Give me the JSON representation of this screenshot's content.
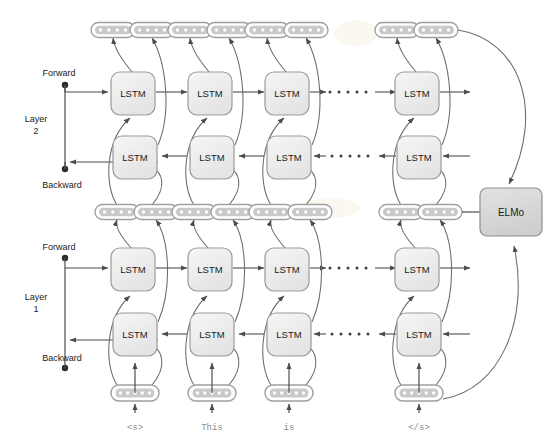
{
  "diagram": {
    "colors": {
      "box_fill": "#eeeeee",
      "box_stroke": "#9a9a9a",
      "pill_fill": "#ffffff",
      "pill_inner_fill": "#c9c9c9",
      "pill_stroke": "#a6a6a6",
      "arrow": "#4d4d4d",
      "text": "#1a1a1a",
      "token_text": "#8a8a8a",
      "elmo_fill": "#d9d9d9",
      "background": "#ffffff"
    },
    "layers": [
      {
        "id": "layer2",
        "label_line1": "Layer",
        "label_line2": "2",
        "forward_label": "Forward",
        "backward_label": "Backward"
      },
      {
        "id": "layer1",
        "label_line1": "Layer",
        "label_line2": "1",
        "forward_label": "Forward",
        "backward_label": "Backward"
      }
    ],
    "cell_label": "LSTM",
    "output_node_label": "ELMo",
    "ellipsis_dot_count": 5,
    "pill_dot_count_top": 4,
    "pill_dot_count_input": 5,
    "tokens": [
      "<s>",
      "This",
      "is",
      "</s>"
    ],
    "columns": [
      {
        "index": 0,
        "token": "<s>",
        "x": 133
      },
      {
        "index": 1,
        "token": "This",
        "x": 210
      },
      {
        "index": 2,
        "token": "is",
        "x": 287
      },
      {
        "index": 3,
        "token": "</s>",
        "x": 417
      }
    ],
    "cells": [
      {
        "layer": 2,
        "direction": "forward",
        "label": "LSTM",
        "column": 0
      },
      {
        "layer": 2,
        "direction": "forward",
        "label": "LSTM",
        "column": 1
      },
      {
        "layer": 2,
        "direction": "forward",
        "label": "LSTM",
        "column": 2
      },
      {
        "layer": 2,
        "direction": "forward",
        "label": "LSTM",
        "column": 3
      },
      {
        "layer": 2,
        "direction": "backward",
        "label": "LSTM",
        "column": 0
      },
      {
        "layer": 2,
        "direction": "backward",
        "label": "LSTM",
        "column": 1
      },
      {
        "layer": 2,
        "direction": "backward",
        "label": "LSTM",
        "column": 2
      },
      {
        "layer": 2,
        "direction": "backward",
        "label": "LSTM",
        "column": 3
      },
      {
        "layer": 1,
        "direction": "forward",
        "label": "LSTM",
        "column": 0
      },
      {
        "layer": 1,
        "direction": "forward",
        "label": "LSTM",
        "column": 1
      },
      {
        "layer": 1,
        "direction": "forward",
        "label": "LSTM",
        "column": 2
      },
      {
        "layer": 1,
        "direction": "forward",
        "label": "LSTM",
        "column": 3
      },
      {
        "layer": 1,
        "direction": "backward",
        "label": "LSTM",
        "column": 0
      },
      {
        "layer": 1,
        "direction": "backward",
        "label": "LSTM",
        "column": 1
      },
      {
        "layer": 1,
        "direction": "backward",
        "label": "LSTM",
        "column": 2
      },
      {
        "layer": 1,
        "direction": "backward",
        "label": "LSTM",
        "column": 3
      }
    ],
    "labels": {
      "layer2_name": "Layer",
      "layer2_num": "2",
      "layer1_name": "Layer",
      "layer1_num": "1",
      "forward": "Forward",
      "backward": "Backward",
      "lstm": "LSTM",
      "elmo": "ELMo",
      "token_0": "<s>",
      "token_1": "This",
      "token_2": "is",
      "token_3": "</s>"
    }
  }
}
